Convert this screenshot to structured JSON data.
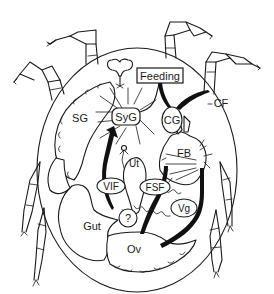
{
  "diagram": {
    "labels": {
      "feeding": "Feeding",
      "synganglion": "SyG",
      "salivary_gland": "SG",
      "cg": "CG",
      "cf": "CF",
      "uterus": "Ut",
      "fat_body": "FB",
      "vif": "VIF",
      "fsf": "FSF",
      "vitellogenin": "Vg",
      "gut": "Gut",
      "ovary": "Ov",
      "unknown": "?"
    },
    "colors": {
      "line": "#1a1a1a",
      "background": "#ffffff"
    }
  }
}
